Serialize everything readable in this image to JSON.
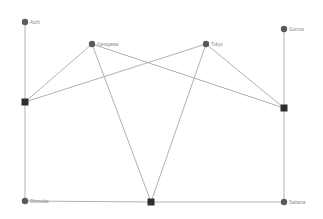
{
  "diagram": {
    "type": "bipartite-network",
    "nodes": [
      {
        "id": "Aichi",
        "label": "Aichi",
        "shape": "circle",
        "x": 25,
        "y": 22
      },
      {
        "id": "Kanagawa",
        "label": "Kanagawa",
        "shape": "circle",
        "x": 92,
        "y": 44
      },
      {
        "id": "Tokyo",
        "label": "Tokyo",
        "shape": "circle",
        "x": 206,
        "y": 44
      },
      {
        "id": "Gunma",
        "label": "Gunma",
        "shape": "circle",
        "x": 284,
        "y": 29
      },
      {
        "id": "Shizuoka",
        "label": "Shizuoka",
        "shape": "circle",
        "x": 25,
        "y": 201
      },
      {
        "id": "Saitama",
        "label": "Saitama",
        "shape": "circle",
        "x": 284,
        "y": 202
      },
      {
        "id": "S1",
        "label": "",
        "shape": "square",
        "x": 25,
        "y": 102
      },
      {
        "id": "S2",
        "label": "",
        "shape": "square",
        "x": 151,
        "y": 202
      },
      {
        "id": "S3",
        "label": "",
        "shape": "square",
        "x": 284,
        "y": 108
      }
    ],
    "edges": [
      [
        "Aichi",
        "S1"
      ],
      [
        "S1",
        "Shizuoka"
      ],
      [
        "Kanagawa",
        "S1"
      ],
      [
        "Kanagawa",
        "S3"
      ],
      [
        "Kanagawa",
        "S2"
      ],
      [
        "Tokyo",
        "S1"
      ],
      [
        "Tokyo",
        "S3"
      ],
      [
        "Tokyo",
        "S2"
      ],
      [
        "Gunma",
        "S3"
      ],
      [
        "S3",
        "Saitama"
      ],
      [
        "Shizuoka",
        "S2"
      ],
      [
        "S2",
        "Saitama"
      ]
    ],
    "colors": {
      "edge": "#a8a8a8",
      "circle_node": "#5a5a5a",
      "square_node": "#2e2e2e",
      "label": "#8a8a8a"
    }
  }
}
